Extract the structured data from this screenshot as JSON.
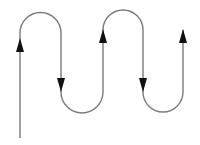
{
  "diagram": {
    "stroke_color": "#7a7a7a",
    "arrow_color": "#111111",
    "background": "#ffffff",
    "segments": [
      {
        "name": "segment-1",
        "direction": "up"
      },
      {
        "name": "segment-2",
        "direction": "down"
      },
      {
        "name": "segment-3",
        "direction": "up"
      },
      {
        "name": "segment-4",
        "direction": "down"
      },
      {
        "name": "segment-5",
        "direction": "up"
      }
    ]
  }
}
